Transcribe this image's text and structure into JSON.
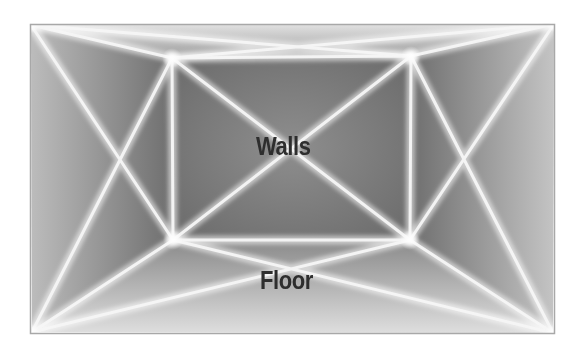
{
  "diagram": {
    "title": "",
    "labels": {
      "walls": "Walls",
      "floor": "Floor"
    },
    "colors": {
      "frame_border": "#9a9a9a",
      "panel_dark": "#6f6f6f",
      "panel_light": "#d6d6d6",
      "line_glow": "#f4f4f4",
      "text": "#2e2e2e"
    },
    "geometry": {
      "outer": {
        "tl": [
          31,
          25
        ],
        "tr": [
          554,
          24
        ],
        "bl": [
          32,
          332
        ],
        "br": [
          553,
          333
        ]
      },
      "inner": {
        "tl": [
          172,
          58
        ],
        "tr": [
          411,
          56
        ],
        "bl": [
          173,
          240
        ],
        "br": [
          410,
          240
        ]
      }
    }
  }
}
